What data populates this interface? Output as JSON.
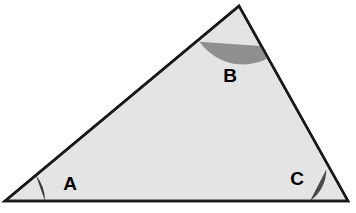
{
  "figure": {
    "kind": "geometry-diagram",
    "width": 356,
    "height": 213,
    "background_color": "#ffffff"
  },
  "triangle": {
    "fill_color": "#e4e4e4",
    "stroke_color": "#1a1a1a",
    "stroke_width": 2.5,
    "vertices": [
      {
        "name": "A",
        "x": 5,
        "y": 201
      },
      {
        "name": "B",
        "x": 239,
        "y": 6
      },
      {
        "name": "C",
        "x": 348,
        "y": 201
      }
    ],
    "points_attr": "5,201 239,6 348,201"
  },
  "angle_marks": [
    {
      "vertex": "A",
      "color": "#3a3a3a",
      "radius": 40,
      "path": "M 45,201 A 40,40 0 0 0 35.9,175.2 Z",
      "position": "bottom-left"
    },
    {
      "vertex": "B",
      "color": "#8f8f8f",
      "radius": 53,
      "path": "M 199.5,41.7 A 53,53 0 0 0 281.9,47.5 Z",
      "position": "top-apex"
    },
    {
      "vertex": "C",
      "color": "#4a4a4a",
      "radius": 38,
      "path": "M 310,201 A 38,38 0 0 0 326.3,169.6 Z",
      "position": "bottom-right"
    }
  ],
  "labels": {
    "a": {
      "text": "A",
      "x": 70,
      "y": 183
    },
    "b": {
      "text": "B",
      "x": 230,
      "y": 75
    },
    "c": {
      "text": "C",
      "x": 297,
      "y": 178
    }
  },
  "chart_data": {
    "type": "diagram",
    "title": "",
    "shape": "triangle",
    "labeled_angles": [
      "A",
      "B",
      "C"
    ]
  }
}
